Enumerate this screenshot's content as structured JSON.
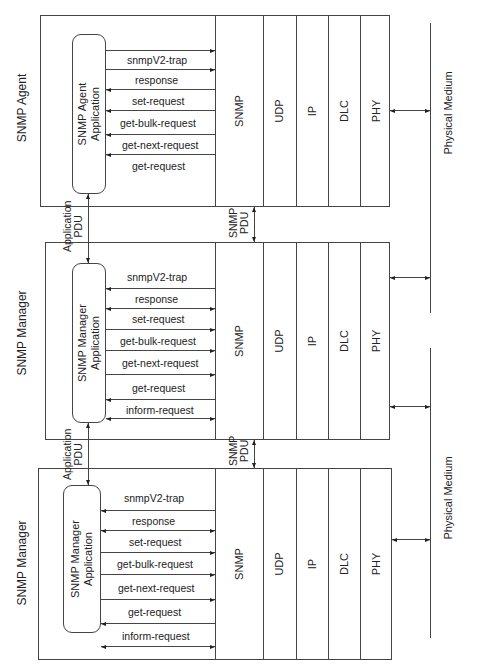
{
  "diagram": {
    "orientation": "rotated-90-ccw",
    "nodes": [
      {
        "title": "SNMP Manager",
        "application": "SNMP Manager Application",
        "application_lines": [
          "SNMP Manager",
          "Application"
        ],
        "messages": [
          "inform-request",
          "get-request",
          "get-next-request",
          "get-bulk-request",
          "set-request",
          "response",
          "snmpV2-trap"
        ],
        "layers": [
          "SNMP",
          "UDP",
          "IP",
          "DLC",
          "PHY"
        ]
      },
      {
        "title": "SNMP Manager",
        "application": "SNMP Manager Application",
        "application_lines": [
          "SNMP Manager",
          "Application"
        ],
        "messages": [
          "inform-request",
          "get-request",
          "get-next-request",
          "get-bulk-request",
          "set-request",
          "response",
          "snmpV2-trap"
        ],
        "layers": [
          "SNMP",
          "UDP",
          "IP",
          "DLC",
          "PHY"
        ]
      },
      {
        "title": "SNMP Agent",
        "application": "SNMP Agent Application",
        "application_lines": [
          "SNMP Agent",
          "Application"
        ],
        "messages": [
          "get-request",
          "get-next-request",
          "get-bulk-request",
          "set-request",
          "response",
          "snmpV2-trap"
        ],
        "layers": [
          "SNMP",
          "UDP",
          "IP",
          "DLC",
          "PHY"
        ]
      }
    ],
    "links": [
      {
        "type": "application",
        "label_lines": [
          "Application",
          "PDU"
        ]
      },
      {
        "type": "application",
        "label_lines": [
          "Application",
          "PDU"
        ]
      },
      {
        "type": "snmp",
        "label_lines": [
          "SNMP",
          "PDU"
        ]
      },
      {
        "type": "snmp",
        "label_lines": [
          "SNMP",
          "PDU"
        ]
      }
    ],
    "physical_media": [
      {
        "label": "Physical Medium"
      },
      {
        "label": "Physical Medium"
      }
    ]
  }
}
